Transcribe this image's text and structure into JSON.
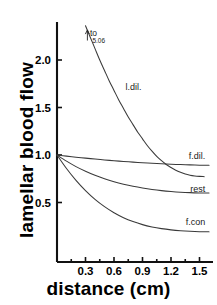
{
  "chart_data": {
    "type": "line",
    "title": "",
    "xlabel": "distance (cm)",
    "ylabel": "lamellar blood flow",
    "xlim": [
      0,
      1.6
    ],
    "ylim": [
      0,
      2.35
    ],
    "grid": false,
    "legend": "inline-curve-labels",
    "xticks": [
      "0.3",
      "0.6",
      "0.9",
      "1.2",
      "1.5"
    ],
    "xtick_values": [
      0.3,
      0.6,
      0.9,
      1.2,
      1.5
    ],
    "yticks": [
      "0.5",
      "1.0",
      "1.5",
      "2.0"
    ],
    "ytick_values": [
      0.5,
      1.0,
      1.5,
      2.0
    ],
    "annotations": [
      {
        "name": "off-scale-arrow",
        "text": "to",
        "value": "5.06",
        "x": 0.32,
        "y": 2.3
      }
    ],
    "series": [
      {
        "name": "l.dil.",
        "label": "l.dil.",
        "label_x": 0.72,
        "label_y": 1.72,
        "x": [
          0.3,
          0.35,
          0.4,
          0.45,
          0.5,
          0.55,
          0.6,
          0.65,
          0.7,
          0.75,
          0.8,
          0.85,
          0.9,
          0.95,
          1.0,
          1.05,
          1.1,
          1.15,
          1.2,
          1.25,
          1.3,
          1.35,
          1.4,
          1.45,
          1.5,
          1.55
        ],
        "y": [
          2.36,
          2.24,
          2.12,
          2.0,
          1.89,
          1.78,
          1.68,
          1.58,
          1.49,
          1.4,
          1.32,
          1.24,
          1.17,
          1.1,
          1.04,
          0.985,
          0.94,
          0.9,
          0.868,
          0.84,
          0.818,
          0.8,
          0.788,
          0.78,
          0.775,
          0.772
        ]
      },
      {
        "name": "f.dil.",
        "label": "f.dil.",
        "label_x": 1.56,
        "label_y": 0.985,
        "x": [
          0.0,
          0.1,
          0.2,
          0.3,
          0.4,
          0.5,
          0.6,
          0.7,
          0.8,
          0.9,
          1.0,
          1.1,
          1.2,
          1.3,
          1.4,
          1.5,
          1.6
        ],
        "y": [
          1.0,
          0.988,
          0.977,
          0.967,
          0.957,
          0.948,
          0.94,
          0.932,
          0.925,
          0.919,
          0.913,
          0.908,
          0.903,
          0.899,
          0.896,
          0.893,
          0.891
        ]
      },
      {
        "name": "rest",
        "label": "rest",
        "label_x": 1.56,
        "label_y": 0.645,
        "x": [
          0.0,
          0.1,
          0.2,
          0.3,
          0.4,
          0.5,
          0.6,
          0.7,
          0.8,
          0.9,
          1.0,
          1.1,
          1.2,
          1.3,
          1.4,
          1.5,
          1.6
        ],
        "y": [
          1.0,
          0.935,
          0.878,
          0.829,
          0.786,
          0.749,
          0.718,
          0.692,
          0.67,
          0.652,
          0.637,
          0.625,
          0.616,
          0.609,
          0.604,
          0.601,
          0.599
        ]
      },
      {
        "name": "f.con",
        "label": "f.con",
        "label_x": 1.56,
        "label_y": 0.295,
        "x": [
          0.0,
          0.1,
          0.2,
          0.3,
          0.4,
          0.5,
          0.6,
          0.7,
          0.8,
          0.9,
          1.0,
          1.1,
          1.2,
          1.3,
          1.4,
          1.5,
          1.6
        ],
        "y": [
          1.0,
          0.858,
          0.733,
          0.625,
          0.533,
          0.456,
          0.392,
          0.34,
          0.299,
          0.267,
          0.243,
          0.225,
          0.212,
          0.203,
          0.197,
          0.193,
          0.191
        ]
      }
    ]
  },
  "axes": {
    "y_title": "lamellar blood flow",
    "x_title": "distance (cm)"
  }
}
